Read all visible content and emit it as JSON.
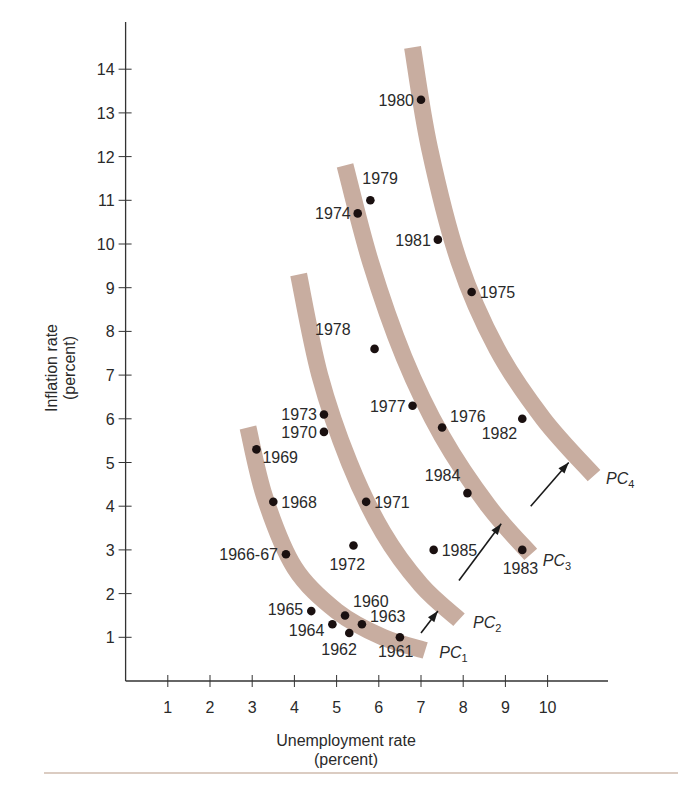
{
  "chart_data": {
    "type": "scatter",
    "title": "",
    "xlabel": "Unemployment rate",
    "xlabel_sub": "(percent)",
    "ylabel": "Inflation rate",
    "ylabel_sub": "(percent)",
    "xlim": [
      0,
      11
    ],
    "ylim": [
      0,
      15
    ],
    "xticks": [
      1,
      2,
      3,
      4,
      5,
      6,
      7,
      8,
      9,
      10
    ],
    "yticks": [
      1,
      2,
      3,
      4,
      5,
      6,
      7,
      8,
      9,
      10,
      11,
      12,
      13,
      14
    ],
    "grid": false,
    "legend": "none",
    "colors": {
      "curve": "#c8ada0",
      "point": "#1a1010",
      "axis": "#333333",
      "text": "#2a2a2a",
      "rule": "#b89a86"
    },
    "points": [
      {
        "label": "1960",
        "x": 5.2,
        "y": 1.5
      },
      {
        "label": "1961",
        "x": 6.5,
        "y": 1.0
      },
      {
        "label": "1962",
        "x": 5.3,
        "y": 1.1
      },
      {
        "label": "1963",
        "x": 5.6,
        "y": 1.3
      },
      {
        "label": "1964",
        "x": 4.9,
        "y": 1.3
      },
      {
        "label": "1965",
        "x": 4.4,
        "y": 1.6
      },
      {
        "label": "1966-67",
        "x": 3.8,
        "y": 2.9
      },
      {
        "label": "1968",
        "x": 3.5,
        "y": 4.1
      },
      {
        "label": "1969",
        "x": 3.1,
        "y": 5.3
      },
      {
        "label": "1970",
        "x": 4.7,
        "y": 5.7
      },
      {
        "label": "1971",
        "x": 5.7,
        "y": 4.1
      },
      {
        "label": "1972",
        "x": 5.4,
        "y": 3.1
      },
      {
        "label": "1973",
        "x": 4.7,
        "y": 6.1
      },
      {
        "label": "1974",
        "x": 5.5,
        "y": 10.7
      },
      {
        "label": "1975",
        "x": 8.2,
        "y": 8.9
      },
      {
        "label": "1976",
        "x": 7.5,
        "y": 5.8
      },
      {
        "label": "1977",
        "x": 6.8,
        "y": 6.3
      },
      {
        "label": "1978",
        "x": 5.9,
        "y": 7.6
      },
      {
        "label": "1979",
        "x": 5.8,
        "y": 11.0
      },
      {
        "label": "1980",
        "x": 7.0,
        "y": 13.3
      },
      {
        "label": "1981",
        "x": 7.4,
        "y": 10.1
      },
      {
        "label": "1982",
        "x": 9.4,
        "y": 6.0
      },
      {
        "label": "1983",
        "x": 9.4,
        "y": 3.0
      },
      {
        "label": "1984",
        "x": 8.1,
        "y": 4.3
      },
      {
        "label": "1985",
        "x": 7.3,
        "y": 3.0
      }
    ],
    "curves": [
      {
        "name": "PC",
        "sub": "1",
        "path": [
          [
            2.9,
            5.8
          ],
          [
            3.3,
            4.2
          ],
          [
            4.0,
            2.6
          ],
          [
            5.0,
            1.6
          ],
          [
            6.1,
            1.0
          ],
          [
            7.1,
            0.7
          ]
        ]
      },
      {
        "name": "PC",
        "sub": "2",
        "path": [
          [
            4.1,
            9.3
          ],
          [
            4.6,
            7.0
          ],
          [
            5.3,
            5.0
          ],
          [
            6.1,
            3.4
          ],
          [
            7.0,
            2.2
          ],
          [
            7.9,
            1.4
          ]
        ]
      },
      {
        "name": "PC",
        "sub": "3",
        "path": [
          [
            5.2,
            11.8
          ],
          [
            5.8,
            9.6
          ],
          [
            6.6,
            7.4
          ],
          [
            7.5,
            5.6
          ],
          [
            8.6,
            4.0
          ],
          [
            9.6,
            2.9
          ]
        ]
      },
      {
        "name": "PC",
        "sub": "4",
        "path": [
          [
            6.8,
            14.5
          ],
          [
            7.2,
            12.2
          ],
          [
            7.9,
            9.6
          ],
          [
            8.8,
            7.6
          ],
          [
            9.9,
            6.0
          ],
          [
            11.1,
            4.7
          ]
        ]
      }
    ],
    "arrows": [
      {
        "from": [
          7.0,
          1.1
        ],
        "to": [
          7.4,
          1.6
        ]
      },
      {
        "from": [
          7.9,
          2.3
        ],
        "to": [
          8.9,
          3.6
        ]
      },
      {
        "from": [
          9.6,
          4.0
        ],
        "to": [
          10.5,
          5.0
        ]
      }
    ]
  }
}
